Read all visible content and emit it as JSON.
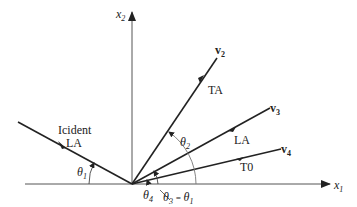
{
  "diagram": {
    "title": "",
    "axes": {
      "x1": {
        "label": "x",
        "subscript": "1"
      },
      "x2": {
        "label": "x",
        "subscript": "2"
      }
    },
    "incident": {
      "line1": "Icident",
      "line2": "LA"
    },
    "vectors": [
      {
        "name": "v",
        "subscript": "2",
        "wave": "TA"
      },
      {
        "name": "v",
        "subscript": "3",
        "wave": "LA"
      },
      {
        "name": "v",
        "subscript": "4",
        "wave": "T0"
      }
    ],
    "angles": {
      "theta1": {
        "symbol": "θ",
        "subscript": "1"
      },
      "theta2": {
        "symbol": "θ",
        "subscript": "2"
      },
      "theta4": {
        "symbol": "θ",
        "subscript": "4"
      },
      "theta3": {
        "symbol": "θ",
        "subscript": "3",
        "eq": " = ",
        "rhs_symbol": "θ",
        "rhs_subscript": "1"
      }
    },
    "colors": {
      "stroke": "#222222",
      "axis": "#555555"
    }
  }
}
